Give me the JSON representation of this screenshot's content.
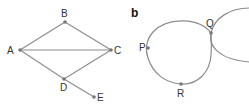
{
  "figure": {
    "panel_a": {
      "label": "",
      "nodes": [
        {
          "id": "A",
          "label": "A"
        },
        {
          "id": "B",
          "label": "B"
        },
        {
          "id": "C",
          "label": "C"
        },
        {
          "id": "D",
          "label": "D"
        },
        {
          "id": "E",
          "label": "E"
        }
      ],
      "edges": [
        [
          "A",
          "B"
        ],
        [
          "B",
          "C"
        ],
        [
          "A",
          "C"
        ],
        [
          "C",
          "D"
        ],
        [
          "A",
          "D"
        ],
        [
          "D",
          "E"
        ]
      ]
    },
    "panel_b": {
      "label": "b",
      "points": [
        {
          "id": "P",
          "label": "P"
        },
        {
          "id": "Q",
          "label": "Q"
        },
        {
          "id": "R",
          "label": "R"
        }
      ],
      "curves": [
        "closed loop through P, Q, R",
        "circle tangent at Q extending right"
      ]
    },
    "colors": {
      "line": "#8c8c8c",
      "node": "#777777",
      "text": "#333333"
    }
  }
}
